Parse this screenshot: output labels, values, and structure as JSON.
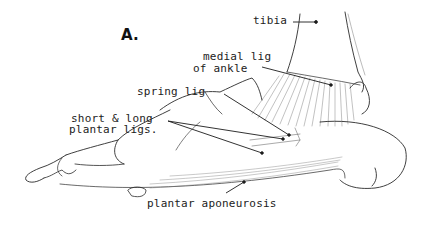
{
  "figure": {
    "panel_label": "A.",
    "labels": {
      "tibia": "tibia",
      "medial_lig_line1": "medial lig",
      "medial_lig_line2": "of ankle",
      "spring_lig": "spring lig",
      "short_long_line1": "short & long",
      "short_long_line2": "plantar ligs.",
      "plantar_aponeurosis": "plantar aponeurosis"
    },
    "colors": {
      "ink": "#1c1c1c",
      "background": "#ffffff"
    }
  }
}
